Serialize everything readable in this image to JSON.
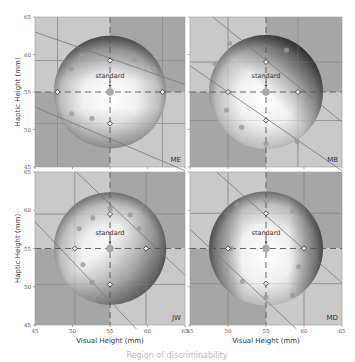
{
  "chart_data": {
    "type": "heatmap",
    "title": "",
    "xlabel": "Visual Height (mm)",
    "ylabel": "Haptic Height (mm)",
    "xlim": [
      45,
      65
    ],
    "ylim": [
      45,
      65
    ],
    "xticks": [
      45,
      50,
      55,
      60,
      65
    ],
    "yticks": [
      45,
      50,
      55,
      60,
      65
    ],
    "grid": true,
    "standard": {
      "label": "standard",
      "x": 55,
      "y": 55
    },
    "caption": "Region of discriminability",
    "panels": [
      {
        "label": "ME",
        "position": "top-left",
        "diamonds": [
          [
            48,
            55
          ],
          [
            62,
            55
          ],
          [
            55,
            59.2
          ],
          [
            55,
            50.8
          ]
        ],
        "samples": [
          [
            51.2,
            59.8
          ],
          [
            58.2,
            59.3
          ],
          [
            49.8,
            58.1
          ],
          [
            60.8,
            58.1
          ],
          [
            49.9,
            52.1
          ],
          [
            52.6,
            51.5
          ]
        ],
        "diagonals": [
          [
            [
              45,
              63
            ],
            [
              65,
              56
            ]
          ],
          [
            [
              45,
              53
            ],
            [
              65,
              44.5
            ]
          ]
        ],
        "shading": "dark-top-and-bottom"
      },
      {
        "label": "MB",
        "position": "top-right",
        "diamonds": [
          [
            50,
            55
          ],
          [
            59.2,
            55
          ],
          [
            55,
            59
          ],
          [
            55,
            51.2
          ]
        ],
        "samples": [
          [
            50.2,
            61.5
          ],
          [
            55,
            59.9
          ],
          [
            57.7,
            60.6
          ],
          [
            48.3,
            58.8
          ],
          [
            49.8,
            52.6
          ],
          [
            51.8,
            50.3
          ],
          [
            55,
            48.1
          ],
          [
            59.1,
            48.4
          ]
        ],
        "diagonals": [
          [
            [
              48,
              65
            ],
            [
              65,
              51
            ]
          ],
          [
            [
              45,
              58.5
            ],
            [
              65,
              44.5
            ]
          ]
        ],
        "shading": "dark-upper-right"
      },
      {
        "label": "JW",
        "position": "bottom-left",
        "diamonds": [
          [
            50.3,
            55
          ],
          [
            59.8,
            55
          ],
          [
            55,
            59.5
          ],
          [
            55,
            50.3
          ]
        ],
        "samples": [
          [
            55,
            60.2
          ],
          [
            52.7,
            59
          ],
          [
            57.7,
            59.4
          ],
          [
            50.9,
            57.6
          ],
          [
            58.9,
            57.6
          ],
          [
            51.4,
            52.9
          ],
          [
            52.6,
            50.6
          ]
        ],
        "diagonals": [
          [
            [
              50.5,
              65
            ],
            [
              65,
              51.5
            ]
          ],
          [
            [
              45,
              58.5
            ],
            [
              58.5,
              44.5
            ]
          ]
        ],
        "shading": "dark-right-and-bottom"
      },
      {
        "label": "MD",
        "position": "bottom-right",
        "diamonds": [
          [
            50,
            55
          ],
          [
            60,
            55
          ],
          [
            55,
            59.6
          ],
          [
            55,
            50.4
          ]
        ],
        "samples": [
          [
            55,
            61.3
          ],
          [
            51.2,
            60.7
          ],
          [
            58.5,
            59.9
          ],
          [
            50.4,
            55
          ],
          [
            49.6,
            52.3
          ],
          [
            51.9,
            50.7
          ],
          [
            59.3,
            52.6
          ],
          [
            58.5,
            48.9
          ],
          [
            55,
            48.6
          ]
        ],
        "diagonals": [
          [
            [
              48.5,
              65
            ],
            [
              65,
              50.5
            ]
          ],
          [
            [
              45,
              57.5
            ],
            [
              59,
              44.5
            ]
          ]
        ],
        "shading": "dark-left-and-right"
      }
    ]
  }
}
